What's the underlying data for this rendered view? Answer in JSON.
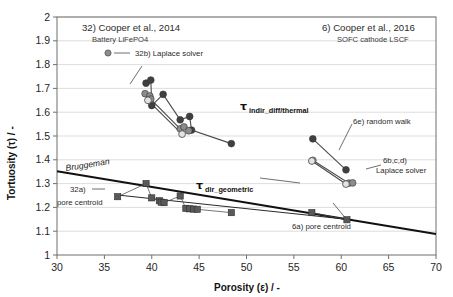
{
  "chart_data": {
    "type": "scatter",
    "title": "",
    "xlabel": "Porosity (ε) / -",
    "ylabel": "Tortuosity (τ) / -",
    "xlim": [
      30,
      70
    ],
    "ylim": [
      1,
      2
    ],
    "xticks": [
      30,
      35,
      40,
      45,
      50,
      55,
      60,
      65,
      70
    ],
    "yticks": [
      1,
      1.1,
      1.2,
      1.3,
      1.4,
      1.5,
      1.6,
      1.7,
      1.8,
      1.9,
      2
    ],
    "grid": "horizontal",
    "legend_position": "inline-annotations",
    "series": [
      {
        "name": "32b) Laplace solver",
        "marker": "circle-dark",
        "color": "#404040",
        "points": [
          [
            39.4,
            1.722
          ],
          [
            39.9,
            1.735
          ],
          [
            41.2,
            1.675
          ],
          [
            40.0,
            1.628
          ],
          [
            43.0,
            1.568
          ],
          [
            44.0,
            1.582
          ],
          [
            44.2,
            1.525
          ],
          [
            48.4,
            1.468
          ]
        ]
      },
      {
        "name": "32b) Laplace solver (mid-gray)",
        "marker": "circle-mid",
        "color": "#8c8c8c",
        "points": [
          [
            39.3,
            1.678
          ],
          [
            39.8,
            1.668
          ],
          [
            39.9,
            1.655
          ],
          [
            43.0,
            1.53
          ],
          [
            43.4,
            1.538
          ],
          [
            43.9,
            1.522
          ]
        ]
      },
      {
        "name": "32b) Laplace solver (open)",
        "marker": "circle-open",
        "color": "#d9d9d9",
        "points": [
          [
            39.6,
            1.65
          ],
          [
            43.2,
            1.508
          ]
        ]
      },
      {
        "name": "6e) random walk",
        "marker": "circle-dark",
        "color": "#404040",
        "points": [
          [
            57.0,
            1.488
          ],
          [
            60.5,
            1.358
          ]
        ]
      },
      {
        "name": "6b,c,d) Laplace solver",
        "marker": "circle-mid",
        "color": "#8c8c8c",
        "points": [
          [
            57.0,
            1.398
          ],
          [
            60.8,
            1.302
          ],
          [
            61.2,
            1.303
          ]
        ]
      },
      {
        "name": "6b,c,d) Laplace solver (open)",
        "marker": "circle-open",
        "color": "#e0e0e0",
        "points": [
          [
            56.9,
            1.395
          ],
          [
            60.5,
            1.298
          ]
        ]
      },
      {
        "name": "32a) pore centroid",
        "marker": "square",
        "color": "#595959",
        "points": [
          [
            36.4,
            1.245
          ],
          [
            39.4,
            1.3
          ],
          [
            40.0,
            1.24
          ],
          [
            40.8,
            1.228
          ],
          [
            41.0,
            1.222
          ],
          [
            41.3,
            1.22
          ],
          [
            43.0,
            1.248
          ],
          [
            43.6,
            1.196
          ],
          [
            44.0,
            1.194
          ],
          [
            44.4,
            1.193
          ],
          [
            44.8,
            1.192
          ],
          [
            48.4,
            1.178
          ]
        ]
      },
      {
        "name": "6a) pore centroid",
        "marker": "square",
        "color": "#595959",
        "points": [
          [
            56.9,
            1.178
          ],
          [
            60.6,
            1.148
          ]
        ]
      }
    ],
    "lines": [
      {
        "name": "Bruggeman",
        "style": "solid-thick",
        "points": [
          [
            30,
            1.352
          ],
          [
            70,
            1.088
          ]
        ]
      },
      {
        "name": "tau_dir_geometric trend",
        "style": "solid-thin",
        "points": [
          [
            36.4,
            1.252
          ],
          [
            60.6,
            1.15
          ]
        ]
      }
    ],
    "annotations": [
      {
        "id": "ref-left-title",
        "text": "32) Cooper et al., 2014"
      },
      {
        "id": "ref-left-sub",
        "text": "Battery LiFePO4"
      },
      {
        "id": "ref-right-title",
        "text": "6) Cooper et al., 2016"
      },
      {
        "id": "ref-right-sub",
        "text": "SOFC cathode LSCF"
      },
      {
        "id": "legend-32b",
        "text": "32b) Laplace solver"
      },
      {
        "id": "tau-indir",
        "text": "indir_diff/thermal"
      },
      {
        "id": "tau-dir",
        "text": "dir_geometric"
      },
      {
        "id": "label-6e",
        "text": "6e) random walk"
      },
      {
        "id": "label-6bcd-1",
        "text": "6b,c,d)"
      },
      {
        "id": "label-6bcd-2",
        "text": "Laplace solver"
      },
      {
        "id": "label-bruggeman",
        "text": "Bruggeman"
      },
      {
        "id": "label-32a-1",
        "text": "32a)"
      },
      {
        "id": "label-32a-2",
        "text": "pore centroid"
      },
      {
        "id": "label-6a",
        "text": "6a) pore centroid"
      }
    ]
  },
  "axes": {
    "x_title": "Porosity (ε) / -",
    "y_title": "Tortuosity (τ) / -",
    "x_ticks": [
      "30",
      "35",
      "40",
      "45",
      "50",
      "55",
      "60",
      "65",
      "70"
    ],
    "y_ticks": [
      "2",
      "1.9",
      "1.8",
      "1.7",
      "1.6",
      "1.5",
      "1.4",
      "1.3",
      "1.2",
      "1.1",
      "1"
    ]
  },
  "labels": {
    "ref_left_title": "32) Cooper et al., 2014",
    "ref_left_sub": "Battery LiFePO4",
    "ref_right_title": "6) Cooper et al., 2016",
    "ref_right_sub": "SOFC cathode LSCF",
    "legend_32b": "32b) Laplace solver",
    "tau_symbol": "τ",
    "tau_indir_sub": "indir_diff/thermal",
    "tau_dir_sub": "dir_geometric",
    "label_6e": "6e) random walk",
    "label_6bcd_line1": "6b,c,d)",
    "label_6bcd_line2": "Laplace solver",
    "label_bruggeman": "Bruggeman",
    "label_32a_line1": "32a)",
    "label_32a_line2": "pore centroid",
    "label_6a": "6a) pore centroid"
  },
  "colors": {
    "marker_dark": "#404040",
    "marker_mid": "#8c8c8c",
    "marker_open_fill": "#e3e3e3",
    "marker_square": "#595959",
    "grid": "#d4d4d4",
    "axis": "#6f6f6f",
    "text": "#262626"
  }
}
